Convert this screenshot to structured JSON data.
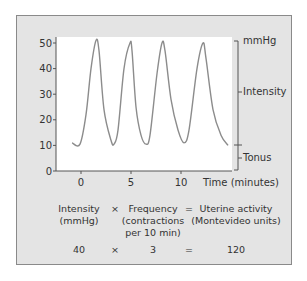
{
  "chart_data": {
    "type": "line",
    "title": "",
    "xlabel": "Time (minutes)",
    "ylabel": "mmHg",
    "xlim": [
      -1,
      15
    ],
    "ylim": [
      0,
      50
    ],
    "x_ticks": [
      0,
      5,
      10
    ],
    "y_ticks": [
      0,
      10,
      20,
      30,
      40,
      50
    ],
    "grid": false,
    "series": [
      {
        "name": "Uterine pressure",
        "x": [
          -0.9,
          -0.1,
          0.5,
          1.0,
          1.5,
          1.8,
          2.3,
          3.0,
          3.3,
          3.7,
          4.3,
          4.9,
          5.1,
          5.5,
          6.0,
          6.5,
          6.9,
          7.6,
          8.1,
          8.4,
          9.0,
          9.7,
          10.3,
          10.8,
          11.6,
          12.2,
          12.5,
          13.2,
          14.0,
          14.7
        ],
        "y": [
          11,
          10.5,
          22,
          40,
          51,
          47,
          24,
          12,
          10.5,
          16,
          40,
          50,
          47,
          25,
          14,
          10.5,
          14,
          38,
          50,
          47,
          28,
          16,
          11,
          16,
          40,
          50,
          44,
          24,
          14,
          10
        ],
        "color": "#8c8c8c"
      }
    ],
    "annotations": [
      {
        "label": "mmHg",
        "y": 50
      },
      {
        "label": "Intensity",
        "y_range": [
          10,
          50
        ]
      },
      {
        "label": "Tonus",
        "y_range": [
          0,
          10
        ]
      }
    ],
    "formula": {
      "terms": [
        {
          "label": "Intensity\n(mmHg)",
          "value": "40"
        },
        {
          "label": "Frequency\n(contractions\nper 10 min)",
          "value": "3"
        },
        {
          "label": "Uterine activity\n(Montevideo units)",
          "value": "120"
        }
      ],
      "operators": [
        "×",
        "="
      ]
    }
  },
  "labels": {
    "y_ticks": [
      "50",
      "40",
      "30",
      "20",
      "10",
      "0"
    ],
    "x_ticks": [
      "0",
      "5",
      "10"
    ],
    "x_axis_title": "Time (minutes)",
    "unit": "mmHg",
    "intensity": "Intensity",
    "tonus": "Tonus"
  },
  "formula": {
    "intensity_label": "Intensity\n(mmHg)",
    "times": "×",
    "frequency_label": "Frequency\n(contractions\nper 10 min)",
    "equals": "=",
    "activity_label": "Uterine activity\n(Montevideo units)",
    "intensity_value": "40",
    "frequency_value": "3",
    "activity_value": "120"
  },
  "colors": {
    "panel": "#e4e4e4",
    "plot": "#ffffff",
    "curve": "#8c8c8c",
    "axis": "#555555"
  }
}
